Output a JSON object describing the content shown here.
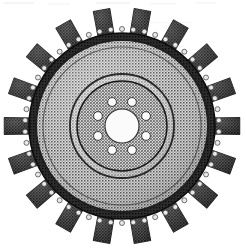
{
  "image": {
    "kind": "halftone-scan",
    "subject": "radial turbine rotor / impeller wheel",
    "alt_text": "Black and white halftone scan of a radial turbine rotor with eighteen textured blades, a studded outer rim, a dithered disc face, a hub plate with eight bolt holes and a central bore.",
    "background_color": "#ffffff",
    "width": 246,
    "height": 252
  },
  "geometry": {
    "center_x": 122,
    "center_y": 126,
    "blade_tip_radius": 118,
    "blade_root_radius": 92,
    "stud_ring_radius": 97,
    "rim_outer_radius": 93,
    "rim_inner_radius": 86,
    "face_outer_radius": 86,
    "mid_ring_radius": 52,
    "hub_plate_radius": 45,
    "bolt_circle_radius": 26,
    "bolt_hole_radius": 4.4,
    "bore_radius": 17
  },
  "counts": {
    "blades": 18,
    "bolt_holes": 8,
    "rim_studs": 54,
    "concentric_rings": 3
  },
  "blade": {
    "angular_half_width_deg": 5.2,
    "taper_ratio": 0.78,
    "fill_color": "#6b6b6b",
    "edge_color": "#2a2a2a"
  },
  "colors": {
    "background": "#ffffff",
    "blade_dark": "#5e5e5e",
    "blade_edge": "#262626",
    "rim_dark": "#1d1d1d",
    "disc_face_mid": "#9a9a9a",
    "disc_face_light": "#bdbdbd",
    "hub_plate": "#8e8e8e",
    "bore_white": "#fbfbfb",
    "stud_light": "#e8e8e8",
    "ring_line": "#303030",
    "artifact_gray": "#ededed"
  },
  "artifacts": {
    "top_scan_streak": true,
    "streak_y": 3,
    "streak_color": "#efefef"
  }
}
